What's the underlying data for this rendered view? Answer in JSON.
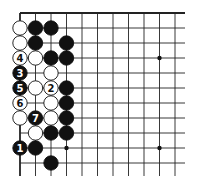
{
  "diagram": {
    "type": "go-board-corner",
    "corner": "top-left",
    "visible_columns": 11,
    "visible_rows": 11,
    "colors": {
      "black": "#111111",
      "white": "#ffffff",
      "line": "#222222",
      "background": "#ffffff"
    },
    "star_points": [
      {
        "col": 9,
        "row": 3
      },
      {
        "col": 3,
        "row": 9
      },
      {
        "col": 9,
        "row": 9
      }
    ],
    "stones": [
      {
        "col": 0,
        "row": 1,
        "color": "white",
        "label": ""
      },
      {
        "col": 1,
        "row": 1,
        "color": "black",
        "label": ""
      },
      {
        "col": 2,
        "row": 1,
        "color": "black",
        "label": ""
      },
      {
        "col": 0,
        "row": 2,
        "color": "white",
        "label": ""
      },
      {
        "col": 1,
        "row": 2,
        "color": "black",
        "label": ""
      },
      {
        "col": 3,
        "row": 2,
        "color": "black",
        "label": ""
      },
      {
        "col": 0,
        "row": 3,
        "color": "white",
        "label": "4"
      },
      {
        "col": 1,
        "row": 3,
        "color": "white",
        "label": ""
      },
      {
        "col": 2,
        "row": 3,
        "color": "black",
        "label": ""
      },
      {
        "col": 3,
        "row": 3,
        "color": "black",
        "label": ""
      },
      {
        "col": 0,
        "row": 4,
        "color": "black",
        "label": "3"
      },
      {
        "col": 2,
        "row": 4,
        "color": "white",
        "label": ""
      },
      {
        "col": 0,
        "row": 5,
        "color": "black",
        "label": "5"
      },
      {
        "col": 1,
        "row": 5,
        "color": "white",
        "label": ""
      },
      {
        "col": 2,
        "row": 5,
        "color": "white",
        "label": "2"
      },
      {
        "col": 3,
        "row": 5,
        "color": "black",
        "label": ""
      },
      {
        "col": 0,
        "row": 6,
        "color": "white",
        "label": "6"
      },
      {
        "col": 2,
        "row": 6,
        "color": "white",
        "label": ""
      },
      {
        "col": 3,
        "row": 6,
        "color": "black",
        "label": ""
      },
      {
        "col": 0,
        "row": 7,
        "color": "white",
        "label": ""
      },
      {
        "col": 1,
        "row": 7,
        "color": "black",
        "label": "7"
      },
      {
        "col": 2,
        "row": 7,
        "color": "white",
        "label": ""
      },
      {
        "col": 3,
        "row": 7,
        "color": "black",
        "label": ""
      },
      {
        "col": 1,
        "row": 8,
        "color": "white",
        "label": ""
      },
      {
        "col": 2,
        "row": 8,
        "color": "black",
        "label": ""
      },
      {
        "col": 3,
        "row": 8,
        "color": "black",
        "label": ""
      },
      {
        "col": 0,
        "row": 9,
        "color": "black",
        "label": "1"
      },
      {
        "col": 1,
        "row": 9,
        "color": "black",
        "label": ""
      },
      {
        "col": 2,
        "row": 10,
        "color": "black",
        "label": ""
      }
    ]
  }
}
